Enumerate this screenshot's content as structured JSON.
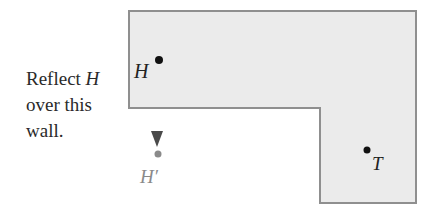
{
  "caption": {
    "line1_prefix": "Reflect ",
    "line1_var": "H",
    "line2": "over this",
    "line3": "wall."
  },
  "labels": {
    "point_h": "H",
    "point_h_prime": "H′",
    "point_t": "T"
  },
  "colors": {
    "region_fill": "#ebebeb",
    "region_stroke": "#8f8f8f",
    "point_dark": "#111111",
    "arrow": "#555555",
    "reflected_point": "#8a8a8a"
  }
}
